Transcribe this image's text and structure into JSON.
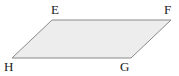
{
  "figure": {
    "name": "parallelogram-efgh",
    "shape_type": "parallelogram",
    "background_color": "#ffffff",
    "fill_color": "#ededed",
    "stroke_color": "#8a8a8a",
    "stroke_width": 1,
    "label_color": "#1a1a1a",
    "canvas": {
      "width": 179,
      "height": 76
    },
    "polygon_points": "52,20 171,20 131,58 12,58",
    "vertices": [
      {
        "id": "E",
        "label": "E",
        "x": 52,
        "y": 20,
        "label_x": 51,
        "label_y": 3
      },
      {
        "id": "F",
        "label": "F",
        "x": 171,
        "y": 20,
        "label_x": 164,
        "label_y": 3
      },
      {
        "id": "G",
        "label": "G",
        "x": 131,
        "y": 58,
        "label_x": 120,
        "label_y": 60
      },
      {
        "id": "H",
        "label": "H",
        "x": 12,
        "y": 58,
        "label_x": 4,
        "label_y": 60
      }
    ],
    "edges": [
      {
        "id": "EF",
        "from": "E",
        "to": "F"
      },
      {
        "id": "FG",
        "from": "F",
        "to": "G"
      },
      {
        "id": "GH",
        "from": "G",
        "to": "H"
      },
      {
        "id": "HE",
        "from": "H",
        "to": "E"
      }
    ]
  }
}
